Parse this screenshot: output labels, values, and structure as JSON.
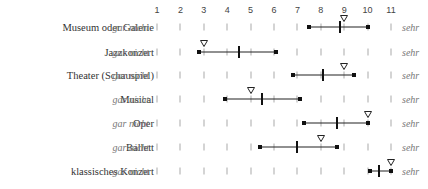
{
  "chart_data": {
    "type": "range-dot",
    "title": "",
    "scale": {
      "min": 1,
      "max": 11,
      "low_anchor": "gar nicht",
      "high_anchor": "sehr"
    },
    "ticks": [
      "1",
      "2",
      "3",
      "4",
      "5",
      "6",
      "7",
      "8",
      "9",
      "10",
      "11"
    ],
    "legend": {
      "range": "Spannweite (Endpunkte)",
      "mean": "Mittelwert (senkrechter Strich)",
      "marker": "Dreieck (▽)"
    },
    "rows": [
      {
        "label": "Museum oder Galerie",
        "low": 7.5,
        "mean": 8.8,
        "triangle": 9.0,
        "high": 10.0
      },
      {
        "label": "Jazzkonzert",
        "low": 2.8,
        "mean": 4.5,
        "triangle": 3.0,
        "high": 6.1
      },
      {
        "label": "Theater (Schauspiel)",
        "low": 6.8,
        "mean": 8.1,
        "triangle": 9.0,
        "high": 9.4
      },
      {
        "label": "Musical",
        "low": 3.9,
        "mean": 5.5,
        "triangle": 5.0,
        "high": 7.1
      },
      {
        "label": "Oper",
        "low": 7.3,
        "mean": 8.7,
        "triangle": 10.0,
        "high": 10.0
      },
      {
        "label": "Ballett",
        "low": 5.4,
        "mean": 7.0,
        "triangle": 8.0,
        "high": 8.7
      },
      {
        "label": "klassisches Konzert",
        "low": 10.1,
        "mean": 10.5,
        "triangle": 11.0,
        "high": 11.0
      }
    ]
  }
}
